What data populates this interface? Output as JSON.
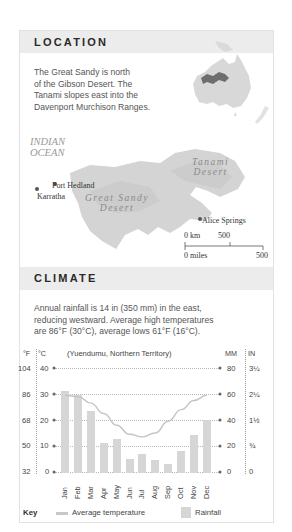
{
  "location": {
    "header": "LOCATION",
    "description": "The Great Sandy is north of the Gibson Desert. The Tanami slopes east into the Davenport Murchison Ranges.",
    "description_lines": [
      "The Great Sandy is north",
      "of the Gibson Desert. The",
      "Tanami slopes east into the",
      "Davenport Murchison Ranges."
    ],
    "map": {
      "ocean_label": [
        "INDIAN",
        "OCEAN"
      ],
      "deserts": [
        {
          "name_lines": [
            "Tanami",
            "Desert"
          ]
        },
        {
          "name_lines": [
            "Great Sandy",
            "Desert"
          ]
        }
      ],
      "towns": [
        "Port Hedland",
        "Karratha",
        "Alice Springs"
      ],
      "scale": {
        "km_label": "0 km",
        "km_value": "500",
        "miles_label": "0 miles",
        "miles_value": "500"
      }
    }
  },
  "climate": {
    "header": "CLIMATE",
    "description": "Annual rainfall is 14 in (350 mm) in the east, reducing westward. Average high temperatures are 86°F (30°C), average lows 61°F (16°C).",
    "description_lines": [
      "Annual rainfall is 14 in (350 mm) in the east,",
      "reducing westward. Average high temperatures",
      "are 86°F (30°C), average lows 61°F (16°C)."
    ],
    "key": {
      "label": "Key",
      "temperature": "Average temperature",
      "rainfall": "Rainfall"
    }
  },
  "chart_data": {
    "type": "bar",
    "title": "(Yuendumu, Northern Territory)",
    "categories": [
      "Jan",
      "Feb",
      "Mar",
      "Apr",
      "May",
      "Jun",
      "Jul",
      "Aug",
      "Sep",
      "Oct",
      "Nov",
      "Dec"
    ],
    "series": [
      {
        "name": "Rainfall",
        "type": "bar",
        "unit": "mm",
        "axis": "right",
        "values": [
          63,
          60,
          48,
          23,
          26,
          11,
          15,
          10,
          7,
          17,
          29,
          41
        ]
      },
      {
        "name": "Average temperature",
        "type": "line",
        "unit": "°C",
        "axis": "left",
        "values": [
          29.5,
          29,
          26.5,
          22.5,
          18,
          14.5,
          13.5,
          15,
          19.5,
          24,
          27.5,
          29.5
        ]
      }
    ],
    "left_axis": {
      "label_f": "°F",
      "label_c": "°C",
      "ticks_c": [
        "40",
        "30",
        "20",
        "10",
        "0"
      ],
      "ticks_f": [
        "104",
        "86",
        "68",
        "50",
        "32"
      ],
      "ylim": [
        0,
        40
      ]
    },
    "right_axis": {
      "label_mm": "MM",
      "label_in": "IN",
      "ticks_mm": [
        "80",
        "60",
        "40",
        "20",
        "0"
      ],
      "ticks_in": [
        "3¼",
        "2¼",
        "1½",
        "¾",
        "0"
      ],
      "ylim": [
        0,
        80
      ]
    },
    "grid": true,
    "legend_position": "bottom"
  }
}
